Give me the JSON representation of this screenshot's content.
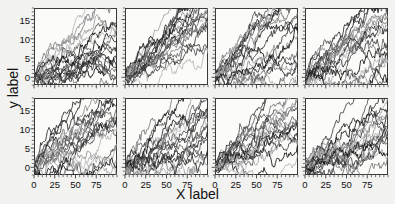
{
  "chart_data": {
    "type": "line",
    "title": "",
    "xlabel": "X label",
    "ylabel": "y label",
    "layout": {
      "rows": 2,
      "cols": 4,
      "shared_x": true,
      "shared_y": true,
      "grid": false,
      "legend": "none"
    },
    "xlim": [
      0,
      100
    ],
    "ylim": [
      -2,
      18
    ],
    "xticks": [
      0,
      25,
      50,
      75
    ],
    "yticks": [
      0,
      5,
      10,
      15
    ],
    "xtick_labels": [
      "0",
      "25",
      "50",
      "75"
    ],
    "ytick_labels": [
      "0",
      "5",
      "10",
      "15"
    ],
    "minor_ticks": true,
    "series_per_panel": 20,
    "panels": [
      {
        "index": 0,
        "row": 0,
        "col": 0,
        "seed": 11,
        "drift": 0.115,
        "noise": 0.95,
        "spread": 0.6,
        "ymax_reached": 15
      },
      {
        "index": 1,
        "row": 0,
        "col": 1,
        "seed": 23,
        "drift": 0.15,
        "noise": 0.9,
        "spread": 0.5,
        "ymax_reached": 18
      },
      {
        "index": 2,
        "row": 0,
        "col": 2,
        "seed": 37,
        "drift": 0.125,
        "noise": 0.95,
        "spread": 0.55,
        "ymax_reached": 16
      },
      {
        "index": 3,
        "row": 0,
        "col": 3,
        "seed": 51,
        "drift": 0.13,
        "noise": 1.0,
        "spread": 0.65,
        "ymax_reached": 16
      },
      {
        "index": 4,
        "row": 1,
        "col": 0,
        "seed": 67,
        "drift": 0.12,
        "noise": 1.0,
        "spread": 0.62,
        "ymax_reached": 15
      },
      {
        "index": 5,
        "row": 1,
        "col": 1,
        "seed": 83,
        "drift": 0.12,
        "noise": 1.05,
        "spread": 0.58,
        "ymax_reached": 15
      },
      {
        "index": 6,
        "row": 1,
        "col": 2,
        "seed": 97,
        "drift": 0.135,
        "noise": 0.95,
        "spread": 0.55,
        "ymax_reached": 16
      },
      {
        "index": 7,
        "row": 1,
        "col": 3,
        "seed": 113,
        "drift": 0.125,
        "noise": 0.98,
        "spread": 0.6,
        "ymax_reached": 15
      }
    ],
    "line_colors": [
      "#101010",
      "#262626",
      "#3a3a3a",
      "#4e4e4e",
      "#626262",
      "#777777",
      "#8c8c8c",
      "#a0a0a0",
      "#b4b4b4"
    ]
  },
  "figure": {
    "background": "#f2f2f0",
    "panel_background": "#fbfbfa",
    "frame_color": "#3a3a3a"
  }
}
